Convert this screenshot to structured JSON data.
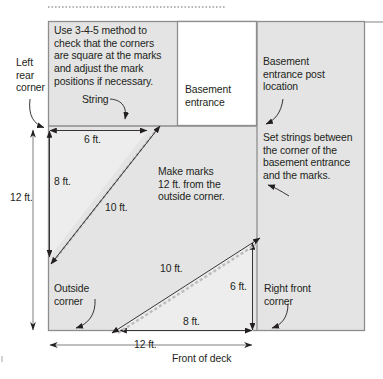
{
  "diagram": {
    "title_note": "Deck layout 3-4-5 squaring diagram",
    "colors": {
      "deck_fill": "#e4e4e4",
      "triangle_fill": "#ededed",
      "outline": "#8e8e8e",
      "line": "#231f20",
      "string_dash": "#b9b9b9",
      "white_box": "#ffffff"
    },
    "notes": {
      "method": "Use 3-4-5 method to\ncheck that the corners\nare square at the marks\nand adjust the mark\npositions if necessary.",
      "marks": "Make marks\n12 ft. from the\noutside corner.",
      "set_strings": "Set strings between\nthe corner of the\nbasement entrance\nand the marks."
    },
    "labels": {
      "left_rear_corner": "Left\nrear\ncorner",
      "string": "String",
      "basement_entrance": "Basement\nentrance",
      "basement_post": "Basement\nentrance post\nlocation",
      "outside_corner": "Outside\ncorner",
      "right_front_corner": "Right front\ncorner",
      "front_of_deck": "Front of deck"
    },
    "dimensions": {
      "top_6ft": "6 ft.",
      "left_8ft": "8 ft.",
      "left_12ft": "12 ft.",
      "upper_diag_10ft": "10 ft.",
      "lower_diag_10ft": "10 ft.",
      "right_6ft": "6 ft.",
      "bottom_8ft": "8 ft.",
      "bottom_12ft": "12 ft."
    }
  }
}
